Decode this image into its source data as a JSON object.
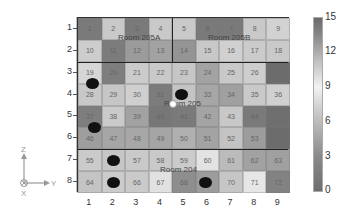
{
  "chart_data": {
    "type": "heatmap",
    "title": "",
    "xlabel": "",
    "ylabel": "",
    "x_ticks": [
      "1",
      "2",
      "3",
      "4",
      "5",
      "6",
      "7",
      "8",
      "9"
    ],
    "y_ticks": [
      "1",
      "2",
      "3",
      "4",
      "5",
      "6",
      "7",
      "8"
    ],
    "colorbar": {
      "min": 0,
      "max": 15,
      "ticks": [
        "0",
        "3",
        "6",
        "9",
        "12",
        "15"
      ]
    },
    "cell_numbers": [
      [
        1,
        2,
        3,
        4,
        5,
        6,
        7,
        8,
        9
      ],
      [
        10,
        11,
        12,
        13,
        14,
        15,
        16,
        17,
        18
      ],
      [
        19,
        20,
        21,
        22,
        23,
        24,
        25,
        26,
        27
      ],
      [
        28,
        29,
        30,
        31,
        32,
        33,
        34,
        35,
        36
      ],
      [
        37,
        38,
        39,
        40,
        41,
        42,
        43,
        44,
        45
      ],
      [
        46,
        47,
        48,
        49,
        50,
        51,
        52,
        53,
        54
      ],
      [
        55,
        56,
        57,
        58,
        59,
        60,
        61,
        62,
        63
      ],
      [
        64,
        65,
        66,
        67,
        68,
        69,
        70,
        71,
        72
      ]
    ],
    "cell_labels_visible": [
      [
        "1",
        "2",
        "3",
        "4",
        "5",
        "6",
        "7",
        "8",
        "9"
      ],
      [
        "10",
        "11",
        "12",
        "13",
        "14",
        "15",
        "16",
        "17",
        "18"
      ],
      [
        "19",
        "20",
        "21",
        "22",
        "23",
        "24",
        "25",
        "26",
        ""
      ],
      [
        "28",
        "29",
        "30",
        "31",
        "32",
        "33",
        "34",
        "35",
        "36"
      ],
      [
        "37",
        "38",
        "39",
        "40",
        "41",
        "42",
        "43",
        "44",
        ""
      ],
      [
        "46",
        "47",
        "48",
        "49",
        "50",
        "51",
        "52",
        "53",
        ""
      ],
      [
        "55",
        "56",
        "57",
        "58",
        "59",
        "60",
        "61",
        "62",
        "63"
      ],
      [
        "64",
        "65",
        "66",
        "67",
        "68",
        "69",
        "70",
        "71",
        "72"
      ]
    ],
    "values": [
      [
        2,
        8,
        2,
        8,
        8,
        2,
        2,
        8,
        9
      ],
      [
        8,
        3,
        5,
        5,
        4,
        8,
        9,
        8,
        8
      ],
      [
        9,
        3,
        8,
        8,
        8,
        5,
        8,
        9,
        1
      ],
      [
        8,
        8,
        9,
        2,
        8,
        6,
        5,
        8,
        9
      ],
      [
        2,
        9,
        5,
        2,
        2,
        5,
        8,
        2,
        1
      ],
      [
        5,
        6,
        6,
        6,
        7,
        6,
        8,
        5,
        1
      ],
      [
        8,
        8,
        8,
        8,
        8,
        9,
        7,
        5,
        5
      ],
      [
        8,
        8,
        8,
        9,
        4,
        5,
        8,
        9,
        2
      ]
    ],
    "shades": [
      [
        "#7a7a7a",
        "#c9c9c9",
        "#7a7a7a",
        "#c9c9c9",
        "#c9c9c9",
        "#7a7a7a",
        "#7a7a7a",
        "#c9c9c9",
        "#d2d2d2"
      ],
      [
        "#cdcdcd",
        "#7c7c7c",
        "#9b9b9b",
        "#a2a2a2",
        "#949494",
        "#c8c8c8",
        "#d0d0d0",
        "#cbcbcb",
        "#c9c9c9"
      ],
      [
        "#d6d6d6",
        "#7e7e7e",
        "#cbcbcb",
        "#c9c9c9",
        "#c6c6c6",
        "#a3a3a3",
        "#c9c9c9",
        "#cecece",
        "#6c6c6c"
      ],
      [
        "#c8c8c8",
        "#c6c6c6",
        "#cfcfcf",
        "#7c7c7c",
        "#c4c4c4",
        "#a6a6a6",
        "#a0a0a0",
        "#c9c9c9",
        "#d0d0d0"
      ],
      [
        "#7e7e7e",
        "#cacaca",
        "#a2a2a2",
        "#777777",
        "#7a7a7a",
        "#a4a4a4",
        "#c8c8c8",
        "#7a7a7a",
        "#6f6f6f"
      ],
      [
        "#9e9e9e",
        "#a6a6a6",
        "#a7a7a7",
        "#a5a5a5",
        "#b0b0b0",
        "#a3a3a3",
        "#c3c3c3",
        "#9c9c9c",
        "#6c6c6c"
      ],
      [
        "#cbcbcb",
        "#c6c6c6",
        "#c9c9c9",
        "#c9c9c9",
        "#cbcbcb",
        "#e3e3e3",
        "#bbbbbb",
        "#a2a2a2",
        "#a0a0a0"
      ],
      [
        "#c4c4c4",
        "#cbcbcb",
        "#cacaca",
        "#e1e1e1",
        "#8e8e8e",
        "#9c9c9c",
        "#c6c6c6",
        "#e6e6e6",
        "#828282"
      ]
    ],
    "rooms": [
      {
        "name": "Room 205A",
        "rows": [
          1,
          2
        ],
        "cols": [
          1,
          4
        ]
      },
      {
        "name": "Room 205B",
        "rows": [
          1,
          2
        ],
        "cols": [
          5,
          9
        ]
      },
      {
        "name": "Room 205",
        "rows": [
          3,
          6
        ],
        "cols": [
          1,
          9
        ]
      },
      {
        "name": "Room 204",
        "rows": [
          7,
          8
        ],
        "cols": [
          1,
          9
        ]
      }
    ],
    "annotations": [
      {
        "type": "black-dot",
        "x": 1.1,
        "y": 3.5
      },
      {
        "type": "black-dot",
        "x": 4.9,
        "y": 4.0
      },
      {
        "type": "black-dot",
        "x": 1.2,
        "y": 5.5
      },
      {
        "type": "black-dot",
        "x": 2.0,
        "y": 7.0
      },
      {
        "type": "black-dot",
        "x": 2.0,
        "y": 8.0
      },
      {
        "type": "black-dot",
        "x": 5.9,
        "y": 8.0
      },
      {
        "type": "white-dot",
        "x": 4.5,
        "y": 4.4
      }
    ],
    "grid": false,
    "legend": "colorbar-right"
  },
  "room_labels": {
    "a": "Room 205A",
    "b": "Room 205B",
    "c": "Room 205",
    "d": "Room 204"
  },
  "colorbar_ticks": [
    "15",
    "12",
    "9",
    "6",
    "3",
    "0"
  ],
  "axes_icon": {
    "z": "Z",
    "y": "Y",
    "x": "X"
  }
}
